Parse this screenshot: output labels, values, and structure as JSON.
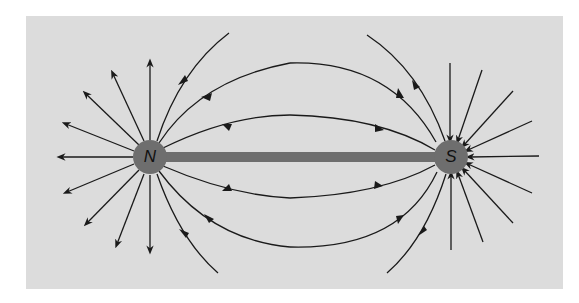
{
  "diagram": {
    "title": "",
    "colors": {
      "background": "#dcdcdc",
      "pole": "#6e6e6e",
      "bar": "#6e6e6e",
      "line": "#1a1a1a"
    },
    "poles": [
      {
        "id": "north",
        "label": "N",
        "cx": 150,
        "cy": 157,
        "r": 17
      },
      {
        "id": "south",
        "label": "S",
        "cx": 451,
        "cy": 157,
        "r": 17
      }
    ],
    "bar": {
      "x1": 167,
      "x2": 434,
      "y": 157,
      "thickness": 10
    },
    "field_direction": "from N to S"
  }
}
